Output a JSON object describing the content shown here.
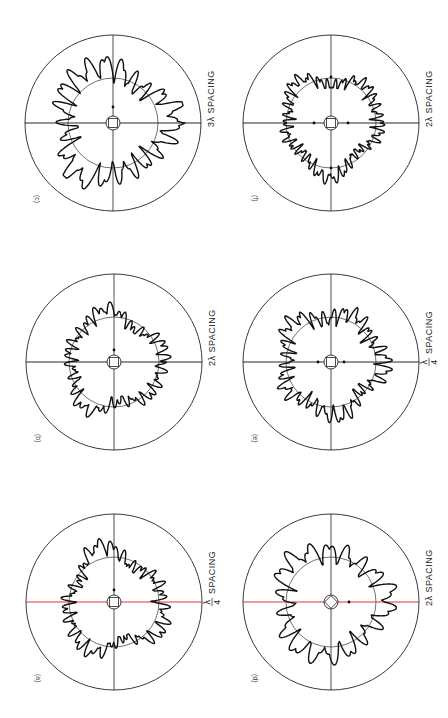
{
  "figure": {
    "orientation": "rotated-90",
    "panels": [
      {
        "id": "c",
        "label": "(c)",
        "spacing": "3λ SPACING",
        "cx": 113,
        "cy": 123,
        "R": 88,
        "r": 45,
        "axis_color": "#111111",
        "seed": 3,
        "lobes": 22,
        "amp": 1.0,
        "dots": [
          [
            113,
            107
          ]
        ]
      },
      {
        "id": "f",
        "label": "(f)",
        "spacing": "2λ SPACING",
        "cx": 331,
        "cy": 123,
        "R": 88,
        "r": 45,
        "axis_color": "#111111",
        "seed": 6,
        "lobes": 34,
        "amp": 0.9,
        "dots": [
          [
            314,
            123
          ],
          [
            348,
            123
          ],
          [
            331,
            77
          ],
          [
            331,
            168
          ]
        ]
      },
      {
        "id": "b",
        "label": "(b)",
        "spacing": "2λ SPACING",
        "cx": 114,
        "cy": 362,
        "R": 88,
        "r": 45,
        "axis_color": "#111111",
        "seed": 2,
        "lobes": 24,
        "amp": 1.0,
        "dots": [
          [
            114,
            350
          ]
        ]
      },
      {
        "id": "e",
        "label": "(e)",
        "spacing_num": "λ",
        "spacing_den": "4",
        "spacing": "SPACING",
        "cx": 331,
        "cy": 362,
        "R": 88,
        "r": 45,
        "axis_color": "#111111",
        "seed": 5,
        "lobes": 30,
        "amp": 0.95,
        "dots": [
          [
            318,
            362
          ],
          [
            344,
            362
          ]
        ]
      },
      {
        "id": "a",
        "label": "(a)",
        "spacing_num": "λ",
        "spacing_den": "4",
        "spacing": "SPACING",
        "cx": 114,
        "cy": 602,
        "R": 88,
        "r": 45,
        "axis_color": "#d62020",
        "seed": 1,
        "lobes": 26,
        "amp": 0.9,
        "dots": [
          [
            114,
            590
          ]
        ]
      },
      {
        "id": "d",
        "label": "(d)",
        "spacing": "2λ SPACING",
        "cx": 331,
        "cy": 602,
        "R": 88,
        "r": 45,
        "axis_color": "#d62020",
        "seed": 4,
        "lobes": 18,
        "amp": 1.0,
        "dots": [
          [
            349,
            602
          ]
        ]
      }
    ]
  }
}
